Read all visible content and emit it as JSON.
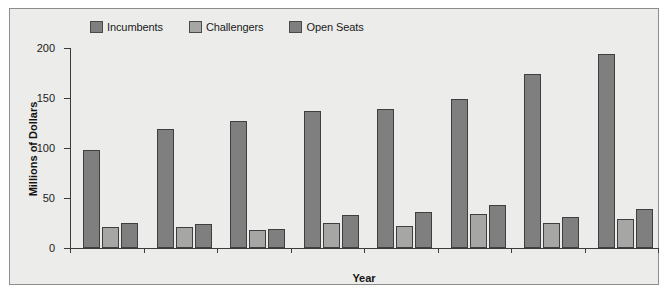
{
  "top_caption": "",
  "chart_data": {
    "type": "bar",
    "title": "",
    "xlabel": "Year",
    "ylabel": "Millions of Dollars",
    "ylim": [
      0,
      200
    ],
    "yticks": [
      0,
      50,
      100,
      150,
      200
    ],
    "ytick_labels": [
      "0",
      "50",
      "100",
      "150",
      "200"
    ],
    "grid": false,
    "legend_position": "top",
    "categories": [
      "1985–1986",
      "1987–1988",
      "1989–1990",
      "1991–1992",
      "1993–1994",
      "1995–1996",
      "1997–1998",
      "1999–2000"
    ],
    "series": [
      {
        "name": "Incumbents",
        "color": "#7f7f7f",
        "values": [
          98,
          119,
          127,
          137,
          139,
          149,
          174,
          194
        ]
      },
      {
        "name": "Challengers",
        "color": "#a6a6a4",
        "values": [
          21,
          21,
          18,
          25,
          22,
          34,
          25,
          29
        ]
      },
      {
        "name": "Open Seats",
        "color": "#7f7f7f",
        "values": [
          25,
          24,
          19,
          33,
          36,
          43,
          31,
          39
        ]
      }
    ]
  },
  "colors": {
    "plot_background": "#ececea",
    "frame_border": "#8d8d8d",
    "axis": "#3c3c3c",
    "bar_outline": "#3f3f3f",
    "incumbents": "#7f7f7f",
    "challengers": "#a6a6a4",
    "open_seats": "#7f7f7f"
  }
}
